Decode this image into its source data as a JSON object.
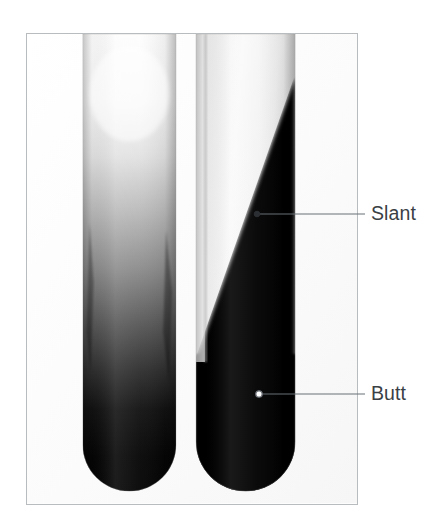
{
  "figure": {
    "kind": "photograph",
    "frame_border_color": "#b9bcbf",
    "background_color": "#ffffff"
  },
  "annotations": [
    {
      "id": "slant",
      "label": "Slant",
      "marker": "filled-dot",
      "marker_point": {
        "x": 257,
        "y": 214
      },
      "elbow_point": {
        "x": 365,
        "y": 214
      },
      "label_position": {
        "x": 371,
        "y": 204
      },
      "line_color": "#6b7077"
    },
    {
      "id": "butt",
      "label": "Butt",
      "marker": "open-dot",
      "marker_point": {
        "x": 259,
        "y": 394
      },
      "elbow_point": {
        "x": 365,
        "y": 394
      },
      "label_position": {
        "x": 371,
        "y": 384
      },
      "line_color": "#6b7077"
    }
  ],
  "photo": {
    "frame": {
      "x": 26,
      "y": 33,
      "width": 332,
      "height": 472
    },
    "tubes": [
      {
        "id": "left-tube",
        "name": "gradient-tube",
        "left": 56,
        "width": 94,
        "bottom_radius": 47,
        "description": "uniform vertical gradient, white at top fading to black at bottom",
        "gradient_stops": [
          {
            "offset": "0%",
            "color": "#fdfdfd"
          },
          {
            "offset": "14%",
            "color": "#f7f7f7"
          },
          {
            "offset": "26%",
            "color": "#e2e2e2"
          },
          {
            "offset": "38%",
            "color": "#b9b9b9"
          },
          {
            "offset": "50%",
            "color": "#8c8c8c"
          },
          {
            "offset": "62%",
            "color": "#575757"
          },
          {
            "offset": "72%",
            "color": "#2e2e2e"
          },
          {
            "offset": "80%",
            "color": "#121212"
          },
          {
            "offset": "90%",
            "color": "#050505"
          },
          {
            "offset": "100%",
            "color": "#030303"
          }
        ]
      },
      {
        "id": "right-tube",
        "name": "slant-butt-tube",
        "left": 170,
        "width": 100,
        "bottom_radius": 50,
        "description": "diagonal slanted agar surface; light slant on upper-left, dark butt filling lower-right",
        "slant_top_x": 100,
        "slant_top_y": 42,
        "slant_bottom_x": 14,
        "slant_bottom_y": 327,
        "slant_color": "#f4f4f4",
        "butt_color": "#050505"
      }
    ]
  },
  "colors": {
    "label_text": "#3a3f45",
    "leader_line": "#6b7077",
    "frame_border": "#b9bcbf",
    "page_background": "#ffffff"
  }
}
